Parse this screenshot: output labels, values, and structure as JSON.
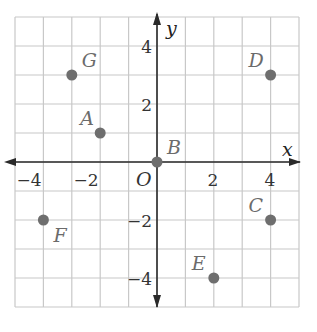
{
  "chart_data": {
    "type": "scatter",
    "title": "",
    "xlabel": "x",
    "ylabel": "y",
    "xlim": [
      -5,
      5
    ],
    "ylim": [
      -5,
      5
    ],
    "grid": true,
    "x_ticks": [
      -4,
      -2,
      2,
      4
    ],
    "y_ticks": [
      4,
      2,
      -2,
      -4
    ],
    "origin_label": "O",
    "points": [
      {
        "label": "G",
        "x": -3,
        "y": 3
      },
      {
        "label": "A",
        "x": -2,
        "y": 1
      },
      {
        "label": "B",
        "x": 0,
        "y": 0
      },
      {
        "label": "D",
        "x": 4,
        "y": 3
      },
      {
        "label": "F",
        "x": -4,
        "y": -2
      },
      {
        "label": "C",
        "x": 4,
        "y": -2
      },
      {
        "label": "E",
        "x": 2,
        "y": -4
      }
    ],
    "colors": {
      "grid": "#c8c8c8",
      "axis": "#2a2a2a",
      "point": "#6e6e6e",
      "label": "#6b6b6b"
    }
  },
  "axes": {
    "x_label": "x",
    "y_label": "y",
    "origin": "O"
  },
  "ticks": {
    "x": [
      "−4",
      "−2",
      "2",
      "4"
    ],
    "y": [
      "4",
      "2",
      "−2",
      "−4"
    ]
  }
}
